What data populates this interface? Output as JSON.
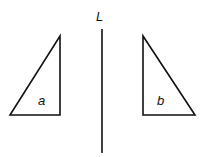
{
  "diagram": {
    "type": "reflection",
    "line": {
      "label": "L",
      "x": 102,
      "y1": 29,
      "y2": 153
    },
    "triangles": [
      {
        "label": "a",
        "points": [
          [
            10,
            115
          ],
          [
            60,
            115
          ],
          [
            60,
            36
          ]
        ],
        "label_pos": [
          38,
          94
        ]
      },
      {
        "label": "b",
        "points": [
          [
            143,
            36
          ],
          [
            143,
            115
          ],
          [
            195,
            115
          ]
        ],
        "label_pos": [
          156,
          94
        ]
      }
    ],
    "colors": {
      "stroke": "#111111",
      "background": "#ffffff"
    }
  }
}
